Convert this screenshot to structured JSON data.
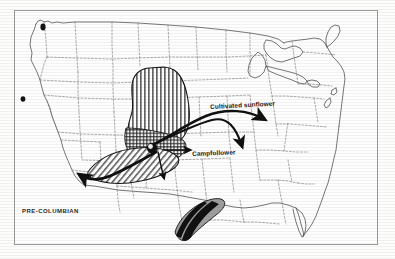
{
  "figure": {
    "title_caption": "PRE-COLUMBIAN",
    "background_color": "#fdfdfc",
    "frame_color": "#9a9a9a",
    "ink_color": "#161616"
  },
  "labels": {
    "cultivated_sunflower": "Cultivated sunflower",
    "campfollower": "Campfollower",
    "period": "PRE-COLUMBIAN"
  },
  "map": {
    "region": "united-states",
    "state_border_style": "dashed",
    "coastline_style": "solid",
    "features": [
      {
        "name": "great-lakes",
        "style": "solid-outline"
      },
      {
        "name": "washington-locality-dot",
        "style": "filled-black"
      },
      {
        "name": "california-locality-dot",
        "style": "filled-black"
      }
    ]
  },
  "regions": [
    {
      "name": "vertical-hatch-core-range",
      "pattern": "vertical-lines",
      "fill": "#1b1b1b",
      "description": "central plains core distribution"
    },
    {
      "name": "cross-hatch-secondary-range",
      "pattern": "cross-hatch",
      "fill": "#1b1b1b",
      "description": "lower central overlap zone"
    },
    {
      "name": "diagonal-hatch-southwest-range",
      "pattern": "diagonal-lines",
      "fill": "#1b1b1b",
      "description": "southwest extension lobe"
    },
    {
      "name": "gulf-crescent-range",
      "pattern": "banded-gray",
      "fill": "#8e8e8e",
      "description": "crescent shaped coastal zone south of the gulf"
    }
  ],
  "arrows": [
    {
      "name": "arrow-northeast-cultivated",
      "label_ref": "cultivated_sunflower",
      "direction": "east"
    },
    {
      "name": "arrow-southeast-campfollower",
      "label_ref": "campfollower",
      "direction": "southeast"
    },
    {
      "name": "arrow-southwest",
      "label_ref": null,
      "direction": "southwest"
    },
    {
      "name": "arrow-south-short",
      "label_ref": null,
      "direction": "south"
    }
  ],
  "colors": {
    "ink": "#161616",
    "hatch": "#1b1b1b",
    "gray_fill": "#8e8e8e",
    "border_dash": "#6f6f6f",
    "frame": "#9a9a9a",
    "paper": "#fdfdfc"
  }
}
